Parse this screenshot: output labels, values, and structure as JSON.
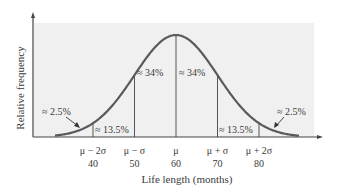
{
  "chart_data": {
    "type": "area",
    "title": "",
    "xlabel": "Life length (months)",
    "ylabel": "Relative frequency",
    "distribution": "normal",
    "mean": 60,
    "std": 10,
    "xlim": [
      30,
      90
    ],
    "grid": false,
    "legend": null,
    "x_ticks": [
      {
        "symbol": "μ − 2σ",
        "value": "40"
      },
      {
        "symbol": "μ − σ",
        "value": "50"
      },
      {
        "symbol": "μ",
        "value": "60"
      },
      {
        "symbol": "μ + σ",
        "value": "70"
      },
      {
        "symbol": "μ + 2σ",
        "value": "80"
      }
    ],
    "regions": [
      {
        "range": [
          null,
          40
        ],
        "label": "≈ 2.5%",
        "percent": 2.5
      },
      {
        "range": [
          40,
          50
        ],
        "label": "≈ 13.5%",
        "percent": 13.5
      },
      {
        "range": [
          50,
          60
        ],
        "label": "≈ 34%",
        "percent": 34
      },
      {
        "range": [
          60,
          70
        ],
        "label": "≈ 34%",
        "percent": 34
      },
      {
        "range": [
          70,
          80
        ],
        "label": "≈ 13.5%",
        "percent": 13.5
      },
      {
        "range": [
          80,
          null
        ],
        "label": "≈ 2.5%",
        "percent": 2.5
      }
    ]
  },
  "colors": {
    "background_panel": "#f0f0f0",
    "curve": "#5a5a5a",
    "axis": "#444444",
    "text": "#3a3a3a"
  }
}
